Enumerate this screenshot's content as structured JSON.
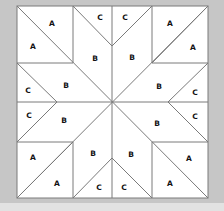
{
  "diagram": {
    "type": "quilt-block-template",
    "colors": {
      "background": "#c6c6c6",
      "block_fill": "#ffffff",
      "line": "#7a7a7a",
      "label": "#111111",
      "bottom_band": "#e2e2e2"
    },
    "bounds": {
      "x1": 17,
      "y1": 6,
      "x2": 208,
      "y2": 198
    },
    "lines": [
      [
        17,
        6,
        208,
        198
      ],
      [
        208,
        6,
        17,
        198
      ],
      [
        112,
        6,
        112,
        198
      ],
      [
        17,
        102,
        208,
        102
      ],
      [
        73,
        6,
        73,
        63
      ],
      [
        17,
        63,
        73,
        63
      ],
      [
        152,
        6,
        152,
        63
      ],
      [
        152,
        63,
        208,
        63
      ],
      [
        17,
        142,
        73,
        142
      ],
      [
        73,
        142,
        73,
        198
      ],
      [
        152,
        142,
        208,
        142
      ],
      [
        152,
        142,
        152,
        198
      ],
      [
        208,
        6,
        152,
        63
      ],
      [
        17,
        198,
        73,
        142
      ],
      [
        73,
        6,
        112,
        46
      ],
      [
        152,
        6,
        112,
        46
      ],
      [
        73,
        198,
        112,
        158
      ],
      [
        152,
        198,
        112,
        158
      ],
      [
        17,
        63,
        57,
        102
      ],
      [
        17,
        142,
        57,
        102
      ],
      [
        208,
        63,
        168,
        102
      ],
      [
        208,
        142,
        168,
        102
      ]
    ],
    "labels": [
      {
        "text": "A",
        "x": 52,
        "y": 24
      },
      {
        "text": "A",
        "x": 33,
        "y": 47
      },
      {
        "text": "C",
        "x": 100,
        "y": 18
      },
      {
        "text": "C",
        "x": 125,
        "y": 18
      },
      {
        "text": "A",
        "x": 170,
        "y": 24
      },
      {
        "text": "A",
        "x": 193,
        "y": 48
      },
      {
        "text": "B",
        "x": 95,
        "y": 59
      },
      {
        "text": "B",
        "x": 132,
        "y": 58
      },
      {
        "text": "B",
        "x": 66,
        "y": 86
      },
      {
        "text": "B",
        "x": 159,
        "y": 87
      },
      {
        "text": "C",
        "x": 28,
        "y": 91
      },
      {
        "text": "C",
        "x": 195,
        "y": 93
      },
      {
        "text": "C",
        "x": 29,
        "y": 116
      },
      {
        "text": "C",
        "x": 195,
        "y": 117
      },
      {
        "text": "B",
        "x": 64,
        "y": 121
      },
      {
        "text": "B",
        "x": 157,
        "y": 124
      },
      {
        "text": "B",
        "x": 93,
        "y": 154
      },
      {
        "text": "B",
        "x": 131,
        "y": 155
      },
      {
        "text": "A",
        "x": 33,
        "y": 158
      },
      {
        "text": "A",
        "x": 189,
        "y": 159
      },
      {
        "text": "A",
        "x": 57,
        "y": 184
      },
      {
        "text": "A",
        "x": 170,
        "y": 184
      },
      {
        "text": "C",
        "x": 99,
        "y": 188
      },
      {
        "text": "C",
        "x": 124,
        "y": 188
      }
    ]
  }
}
